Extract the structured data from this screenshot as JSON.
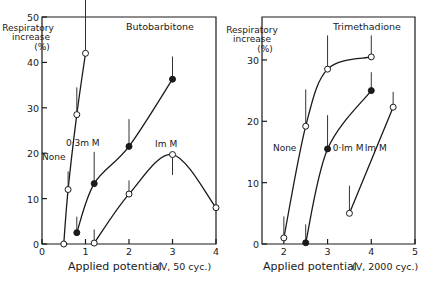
{
  "chart_data": [
    {
      "type": "line",
      "title": "Butobarbitone",
      "xlabel": "Applied potential",
      "xlabel_units": "(V, 50 cyc.)",
      "ylabel": "Respiratory increase (%)",
      "ylabel_lines": [
        "Respiratory",
        "increase",
        "(%)"
      ],
      "xlim": [
        0,
        4
      ],
      "ylim": [
        0,
        50
      ],
      "x_ticks": [
        "0",
        "1",
        "2",
        "3",
        "4"
      ],
      "y_ticks": [
        "0",
        "10",
        "20",
        "30",
        "40",
        "50"
      ],
      "grid": false,
      "series": [
        {
          "name": "None",
          "marker": "open",
          "x": [
            0.5,
            0.6,
            0.8,
            1.0
          ],
          "y": [
            0,
            12,
            28.5,
            42
          ],
          "err_up": [
            0,
            4,
            6,
            13
          ]
        },
        {
          "name": "0·3m M",
          "marker": "filled",
          "x": [
            0.8,
            1.2,
            2.0,
            3.0
          ],
          "y": [
            2.5,
            13.3,
            21.5,
            36.3
          ],
          "err_up": [
            3.5,
            7,
            6,
            5
          ]
        },
        {
          "name": "Im M",
          "marker": "open",
          "x": [
            1.2,
            2.0,
            3.0,
            4.0
          ],
          "y": [
            0.2,
            11,
            19.7,
            8
          ],
          "err_up": [
            3,
            3,
            -4.5,
            0
          ]
        }
      ],
      "labels": [
        {
          "text": "None",
          "x": 0.0,
          "y": 18.5
        },
        {
          "text": "0·3m M",
          "x": 0.55,
          "y": 21.5
        },
        {
          "text": "Im M",
          "x": 2.6,
          "y": 21.3
        }
      ]
    },
    {
      "type": "line",
      "title": "Trimethadione",
      "xlabel": "Applied potential",
      "xlabel_units": "(V, 2000 cyc.)",
      "ylabel": "Respiratory increase (%)",
      "ylabel_lines": [
        "Respiratory",
        "increase",
        "(%)"
      ],
      "xlim": [
        1.5,
        5
      ],
      "ylim": [
        0,
        37
      ],
      "x_ticks": [
        "2",
        "3",
        "4",
        "5"
      ],
      "y_ticks": [
        "0",
        "10",
        "20",
        "30"
      ],
      "grid": false,
      "series": [
        {
          "name": "None",
          "marker": "open",
          "x": [
            2.0,
            2.5,
            3.0,
            4.0
          ],
          "y": [
            1,
            19.2,
            28.5,
            30.5
          ],
          "err_up": [
            3.5,
            6,
            5.5,
            3.5
          ]
        },
        {
          "name": "0·Im M",
          "marker": "filled",
          "x": [
            2.5,
            3.0,
            4.0
          ],
          "y": [
            0.2,
            15.5,
            25
          ],
          "err_up": [
            3,
            5.5,
            3
          ]
        },
        {
          "name": "Im M",
          "marker": "open",
          "x": [
            3.5,
            4.5
          ],
          "y": [
            5,
            22.3
          ],
          "err_up": [
            4.5,
            2.5
          ]
        }
      ],
      "labels": [
        {
          "text": "None",
          "x": 1.75,
          "y": 15.2
        },
        {
          "text": "0·Im M",
          "x": 3.12,
          "y": 15.2
        },
        {
          "text": "Im M",
          "x": 3.85,
          "y": 15.2
        }
      ]
    }
  ]
}
